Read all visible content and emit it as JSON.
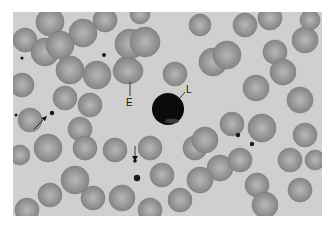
{
  "figure": {
    "type": "blood smear micrograph",
    "background": "#cfcfcf",
    "labels": [
      {
        "id": "E",
        "text": "E",
        "meaning": "erythrocyte"
      },
      {
        "id": "L",
        "text": "L",
        "meaning": "lymphocyte"
      }
    ],
    "arrows": 2,
    "colors": {
      "cell": "#8f8f8f",
      "cell_center": "#b4b4b4",
      "nucleus": "#0a0a0a",
      "platelet": "#1a1a1a"
    }
  }
}
